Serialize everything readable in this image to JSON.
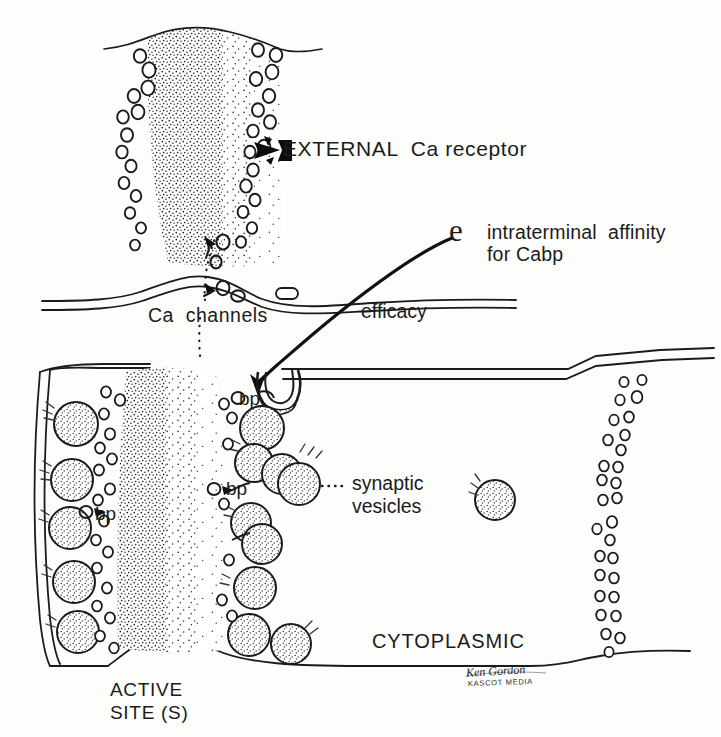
{
  "figure": {
    "background_color": "#fdfdfc",
    "ink_color": "#1b1b1b"
  },
  "labels": {
    "external_receptor": "EXTERNAL  Ca receptor",
    "efficacy_symbol": "e",
    "intraterminal_affinity": "intraterminal  affinity\nfor Cabp",
    "ca_channels": "Ca  channels",
    "efficacy": "efficacy",
    "bp_1": "bp",
    "bp_2": "bp",
    "bp_3": "bp",
    "synaptic_vesicles": "synaptic\nvesicles",
    "cytoplasmic": "CYTOPLASMIC",
    "active_sites": "ACTIVE\nSITE (S)",
    "signature_name": "Ken Gordon",
    "signature_studio": "KASCOT MEDIA"
  },
  "annotations": {
    "arrow_to_receptor": "black solid arrow pointing left at an external Ca receptor circle",
    "leader_ca_channels": "dotted leader from Ca channels label up to membrane channels",
    "leader_synaptic_vesicles": "dotted leader from label to a vesicle",
    "efficacy_curve": "curved line from e symbol down to membrane invagination, arrowhead at terminal"
  },
  "structures": {
    "upper_cleft": "stippled calcium gradient column with receptor circles flanking",
    "postsynaptic_membrane": "wavy double line across upper-middle",
    "terminal_membrane": "double-line bounded presynaptic terminal occupying lower two thirds",
    "vesicle_count_left_wall": 5,
    "vesicle_clusters_center": 9,
    "free_vesicle_right": 1,
    "calcium_column_right": "vertical chain of small circles descending from terminal roof"
  }
}
